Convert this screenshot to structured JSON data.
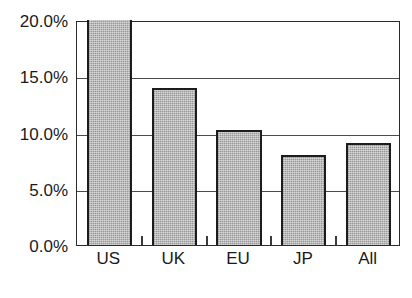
{
  "chart_data": {
    "type": "bar",
    "title": "",
    "xlabel": "",
    "ylabel": "",
    "categories": [
      "US",
      "UK",
      "EU",
      "JP",
      "All"
    ],
    "values": [
      20.0,
      14.0,
      10.2,
      8.0,
      9.1
    ],
    "value_unit": "%",
    "ylim": [
      0.0,
      20.0
    ],
    "yticks": [
      0.0,
      5.0,
      10.0,
      15.0,
      20.0
    ],
    "ytick_labels": [
      "0.0%",
      "5.0%",
      "10.0%",
      "15.0%",
      "20.0%"
    ],
    "grid": true,
    "grid_axis": "y",
    "legend": false,
    "legend_position": "none",
    "bar_fill_color": "#a9a9a9",
    "bar_edge_color": "#1c1c1c",
    "axis_color": "#2b2b2b",
    "gridline_color": "#4a4a4a",
    "background_color": "#ffffff",
    "text_color": "#1a1a1a"
  }
}
